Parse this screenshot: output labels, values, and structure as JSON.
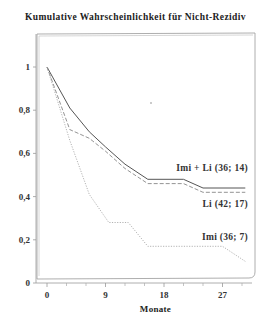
{
  "chart_data": {
    "type": "line",
    "title": "Kumulative Wahrscheinlichkeit für Nicht-Rezidiv",
    "xlabel": "Monate",
    "ylabel": "",
    "xlim": [
      0,
      31
    ],
    "ylim": [
      0,
      1.1
    ],
    "x_ticks": [
      0,
      9,
      18,
      27
    ],
    "x_minor_ticks": [
      3,
      6,
      12,
      15,
      21,
      24,
      30
    ],
    "y_ticks": [
      0,
      0.2,
      0.4,
      0.6,
      0.8,
      1
    ],
    "y_tick_labels": [
      "0",
      "0,2",
      "0,4",
      "0,6",
      "0,8",
      "1"
    ],
    "grid": false,
    "legend_position": "inline labels at right end of curves",
    "series": [
      {
        "name": "Imi + Li (36; 14)",
        "style": "solid",
        "color": "#555555",
        "x": [
          0,
          3.5,
          6.5,
          9,
          12,
          15.5,
          21,
          24,
          30.5
        ],
        "y": [
          1.0,
          0.81,
          0.7,
          0.63,
          0.55,
          0.48,
          0.48,
          0.44,
          0.44
        ]
      },
      {
        "name": "Li (42; 17)",
        "style": "dashed",
        "color": "#888888",
        "x": [
          0,
          3.5,
          6.5,
          9,
          12,
          15.5,
          21,
          24,
          30.5
        ],
        "y": [
          1.0,
          0.71,
          0.67,
          0.61,
          0.53,
          0.46,
          0.46,
          0.42,
          0.42
        ]
      },
      {
        "name": "Imi (36; 7)",
        "style": "dotted",
        "color": "#aaaaaa",
        "x": [
          0,
          3.5,
          6.5,
          9.5,
          12.5,
          15.5,
          27,
          30.5
        ],
        "y": [
          1.0,
          0.66,
          0.41,
          0.28,
          0.28,
          0.17,
          0.17,
          0.1
        ]
      }
    ]
  }
}
